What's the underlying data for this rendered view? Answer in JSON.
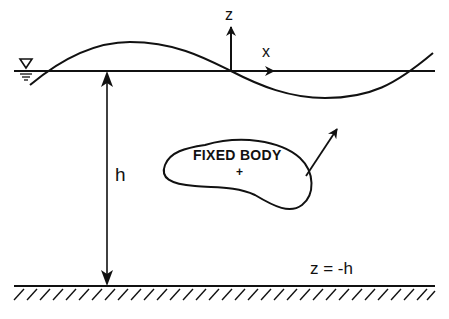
{
  "diagram": {
    "type": "wave-body interaction schematic",
    "labels": {
      "z_axis": "z",
      "x_axis": "x",
      "depth": "h",
      "body": "FIXED BODY",
      "body_origin": "+",
      "seabed_condition": "z = -h"
    },
    "elements": [
      "free-surface still water line",
      "water level symbol",
      "incident wave profile",
      "z axis arrow",
      "x axis arrow",
      "depth dimension arrow",
      "fixed body outline",
      "outward normal arrow",
      "hatched seabed"
    ],
    "colors": {
      "stroke": "#111111",
      "background": "#ffffff"
    }
  }
}
